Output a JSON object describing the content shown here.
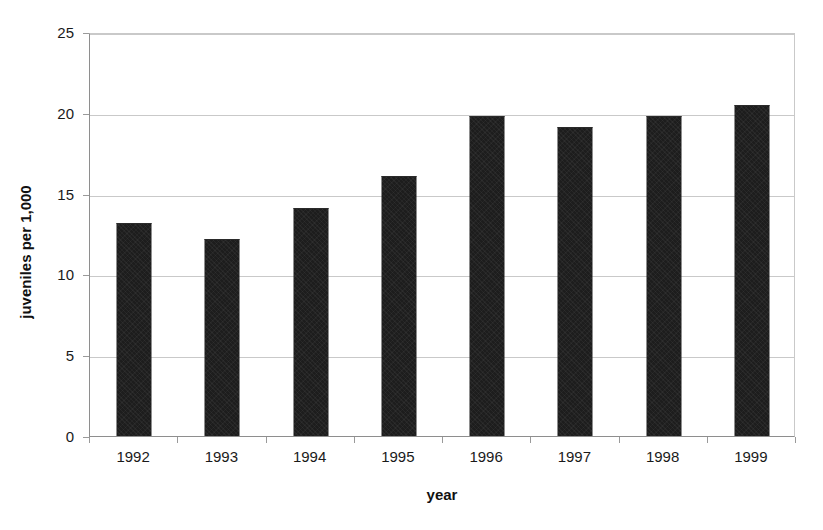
{
  "chart_data": {
    "type": "bar",
    "title": "",
    "subtitle": "",
    "xlabel": "year",
    "ylabel": "juveniles per 1,000",
    "categories": [
      "1992",
      "1993",
      "1994",
      "1995",
      "1996",
      "1997",
      "1998",
      "1999"
    ],
    "values": [
      13.2,
      12.2,
      14.1,
      16.1,
      19.8,
      19.1,
      19.8,
      20.5
    ],
    "series": [
      {
        "name": "juveniles per 1,000",
        "values": [
          13.2,
          12.2,
          14.1,
          16.1,
          19.8,
          19.1,
          19.8,
          20.5
        ]
      }
    ],
    "ylim": [
      0,
      25
    ],
    "yticks": [
      "0",
      "5",
      "10",
      "15",
      "20",
      "25"
    ],
    "ytick_values": [
      0,
      5,
      10,
      15,
      20,
      25
    ],
    "grid": "horizontal",
    "legend": "none",
    "bar_color": "#1d1d1d",
    "gridline_color": "#c9c9c9",
    "axis_color": "#8e8e8e",
    "background_color": "#ffffff",
    "annotations": []
  }
}
